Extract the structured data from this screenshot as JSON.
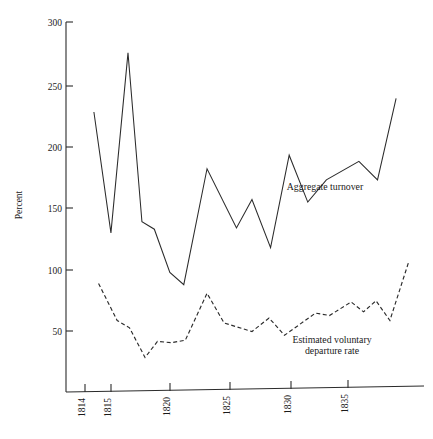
{
  "chart_data": {
    "type": "line",
    "title": "",
    "xlabel": "",
    "ylabel": "Percent",
    "xlim": [
      1813.4,
      1836.5
    ],
    "ylim": [
      0,
      300
    ],
    "grid": false,
    "legend_position": "inline-annotations",
    "x_ticks": [
      "1814",
      "1815",
      "1820",
      "1825",
      "1830",
      "1835"
    ],
    "x_tick_values": [
      1814,
      1815,
      1820,
      1825,
      1830,
      1835
    ],
    "y_ticks": [
      "50",
      "100",
      "150",
      "200",
      "250",
      "300"
    ],
    "y_tick_values": [
      50,
      100,
      150,
      200,
      250,
      300
    ],
    "series": [
      {
        "name": "Aggregate turnover",
        "style": "solid",
        "annotation": "Aggregate turnover",
        "x": [
          1815.2,
          1816.3,
          1817.4,
          1818.3,
          1819.1,
          1820.1,
          1821.0,
          1822.5,
          1824.4,
          1825.4,
          1826.6,
          1827.8,
          1829.0,
          1830.2,
          1832.3,
          1833.5,
          1834.7
        ],
        "values": [
          227,
          129,
          275,
          138,
          132,
          97,
          87,
          181,
          133,
          156,
          117,
          192,
          154,
          172,
          187,
          172,
          238
        ]
      },
      {
        "name": "Estimated voluntary departure rate",
        "style": "dashed",
        "annotation": "Estimated voluntary departure rate",
        "x": [
          1815.5,
          1816.7,
          1817.5,
          1818.5,
          1819.3,
          1820.2,
          1821.1,
          1822.5,
          1823.6,
          1825.4,
          1826.5,
          1827.5,
          1829.5,
          1830.4,
          1831.8,
          1832.6,
          1833.4,
          1834.3,
          1835.5
        ],
        "values": [
          88,
          58,
          52,
          28,
          41,
          40,
          42,
          80,
          56,
          49,
          60,
          46,
          64,
          62,
          73,
          65,
          74,
          58,
          105
        ]
      }
    ],
    "annotations": [
      {
        "text_line_1": "Aggregate turnover",
        "text_line_2": ""
      },
      {
        "text_line_1": "Estimated voluntary",
        "text_line_2": "departure rate"
      }
    ]
  },
  "labels": {
    "y_axis_title": "Percent",
    "annot_aggregate": "Aggregate turnover",
    "annot_departure_line1": "Estimated voluntary",
    "annot_departure_line2": "departure rate"
  },
  "colors": {
    "ink": "#2b2b2b",
    "background": "#ffffff"
  }
}
